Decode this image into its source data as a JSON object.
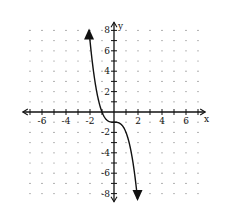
{
  "chart_data": {
    "type": "line",
    "title": "",
    "xlabel": "x",
    "ylabel": "y",
    "xlim": [
      -7,
      7
    ],
    "ylim": [
      -8,
      8
    ],
    "grid": "dots",
    "x_tick_labels": [
      "-6",
      "-4",
      "-2",
      "2",
      "4",
      "6"
    ],
    "y_tick_labels": [
      "8",
      "6",
      "4",
      "2",
      "-2",
      "-4",
      "-6",
      "-8"
    ],
    "series": [
      {
        "name": "y = -x^3 - 1",
        "function": "-x^3 - 1",
        "x": [
          -2.1,
          -2,
          -1.5,
          -1,
          -0.5,
          0,
          0.5,
          1,
          1.5,
          1.95
        ],
        "values": [
          8.26,
          7,
          2.38,
          0,
          -0.88,
          -1,
          -1.13,
          -2,
          -4.38,
          -8.4
        ],
        "arrows_at_ends": true
      }
    ]
  },
  "axes": {
    "x_label": "x",
    "y_label": "y"
  }
}
